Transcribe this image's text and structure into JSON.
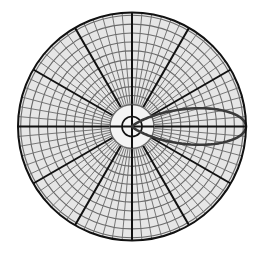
{
  "diagram": {
    "type": "polar-radiation-pattern",
    "center": [
      132,
      126.5
    ],
    "outer_radius": 114,
    "hub": {
      "outer_radius": 22,
      "inner_radius": 10
    },
    "major_spokes_deg": [
      0,
      30,
      60,
      90,
      120,
      150,
      180,
      210,
      240,
      270,
      300,
      330
    ],
    "minor_spoke_step_deg": 5,
    "ring_count": 10,
    "lobe": {
      "direction_deg": 0,
      "length_fraction": 1.0,
      "half_beamwidth_deg": 18
    },
    "colors": {
      "background": "#ffffff",
      "major_line": "#111111",
      "minor_line": "#6a6a6a",
      "fill": "#e6e6e6",
      "lobe": "#3a3a3a"
    }
  }
}
